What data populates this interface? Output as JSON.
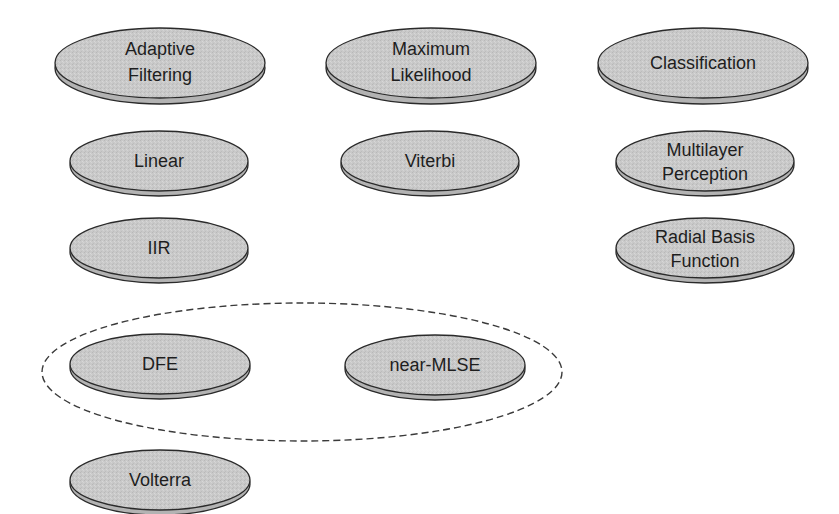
{
  "diagram": {
    "colors": {
      "disc_fill": "#c9c9c9",
      "disc_rim": "#b3b3b3",
      "outline": "#2a2a2a",
      "text": "#1e1e1e",
      "group_dash": "#3a3a3a"
    },
    "columns": [
      {
        "heading": {
          "lines": [
            "Adaptive",
            "Filtering"
          ]
        },
        "items": [
          {
            "lines": [
              "Linear"
            ]
          },
          {
            "lines": [
              "IIR"
            ]
          },
          {
            "lines": [
              "DFE"
            ]
          },
          {
            "lines": [
              "Volterra"
            ]
          }
        ]
      },
      {
        "heading": {
          "lines": [
            "Maximum",
            "Likelihood"
          ]
        },
        "items": [
          {
            "lines": [
              "Viterbi"
            ]
          },
          {
            "lines": [
              "near-MLSE"
            ]
          }
        ]
      },
      {
        "heading": {
          "lines": [
            "Classification"
          ]
        },
        "items": [
          {
            "lines": [
              "Multilayer",
              "Perception"
            ]
          },
          {
            "lines": [
              "Radial Basis",
              "Function"
            ]
          }
        ]
      }
    ],
    "group": {
      "style": "dashed-ellipse",
      "members": [
        "DFE",
        "near-MLSE"
      ]
    }
  }
}
